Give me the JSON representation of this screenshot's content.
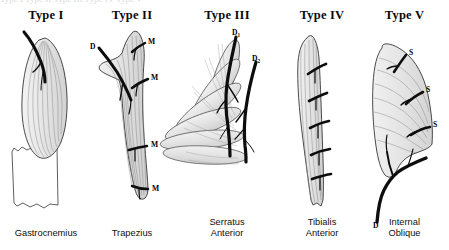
{
  "figure": {
    "title_fragment_top": "Type I              Type II              Type III              Type IV              Type V",
    "panels": [
      {
        "id": "type-1",
        "heading": "Type I",
        "muscle_name": "Gastrocnemius",
        "description": "One vascular pedicle",
        "pedicle_labels": []
      },
      {
        "id": "type-2",
        "heading": "Type II",
        "muscle_name": "Trapezius",
        "description": "Dominant pedicle plus minor pedicles",
        "pedicle_labels": [
          {
            "text": "D",
            "sub": ""
          },
          {
            "text": "M",
            "sub": ""
          },
          {
            "text": "M",
            "sub": ""
          },
          {
            "text": "M",
            "sub": ""
          },
          {
            "text": "M",
            "sub": ""
          }
        ]
      },
      {
        "id": "type-3",
        "heading": "Type III",
        "muscle_name": "Serratus\nAnterior",
        "description": "Two dominant pedicles",
        "pedicle_labels": [
          {
            "text": "D",
            "sub": "1"
          },
          {
            "text": "D",
            "sub": "2"
          }
        ]
      },
      {
        "id": "type-4",
        "heading": "Type IV",
        "muscle_name": "Tibialis\nAnterior",
        "description": "Segmental pedicles",
        "pedicle_labels": []
      },
      {
        "id": "type-5",
        "heading": "Type V",
        "muscle_name": "Internal\nOblique",
        "description": "One dominant pedicle plus secondary segmental pedicles",
        "pedicle_labels": [
          {
            "text": "S",
            "sub": ""
          },
          {
            "text": "S",
            "sub": ""
          },
          {
            "text": "S",
            "sub": ""
          },
          {
            "text": "D",
            "sub": ""
          }
        ]
      }
    ],
    "colors": {
      "background": "#ffffff",
      "muscle_fill": "#e9e9e9",
      "muscle_outline": "#2b2b2b",
      "fiber_line": "#8d8d8d",
      "vessel": "#0d0d0d",
      "text": "#0a0a0a"
    }
  }
}
